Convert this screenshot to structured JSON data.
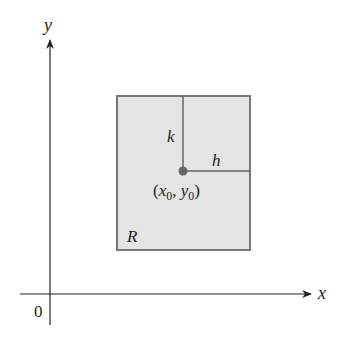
{
  "diagram": {
    "axes": {
      "x_label": "x",
      "y_label": "y",
      "origin_label": "0"
    },
    "region": {
      "label": "R",
      "fill_color": "#e4e4e4",
      "border_color": "#777777"
    },
    "center_point": {
      "label_open": "(",
      "x_var": "x",
      "x_sub": "0",
      "sep": ", ",
      "y_var": "y",
      "y_sub": "0",
      "label_close": ")",
      "color": "#666666"
    },
    "half_width_label": "h",
    "half_height_label": "k"
  }
}
